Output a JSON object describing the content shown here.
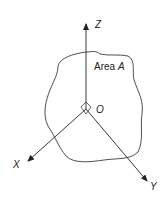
{
  "diagram": {
    "labels": {
      "z_axis": "Z",
      "x_axis": "X",
      "y_axis": "Y",
      "origin": "O",
      "area_prefix": "Area ",
      "area_symbol": "A"
    },
    "colors": {
      "stroke": "#222222",
      "background": "#ffffff"
    }
  }
}
